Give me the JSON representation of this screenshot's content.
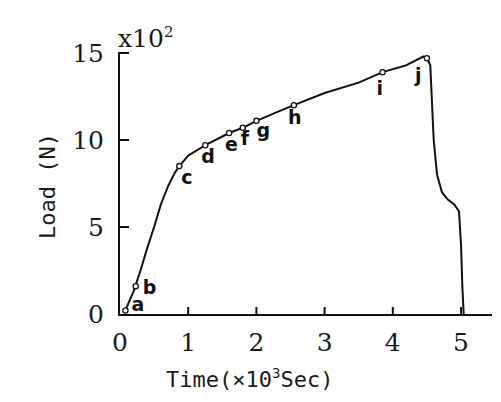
{
  "chart_data": {
    "type": "line",
    "title": "",
    "xlabel": "Time(×10³Sec)",
    "ylabel": "Load (N)",
    "y_multiplier_label": "x10²",
    "xlim": [
      0,
      5.4
    ],
    "ylim": [
      0,
      15
    ],
    "x_ticks": [
      0,
      1,
      2,
      3,
      4,
      5
    ],
    "x_tick_labels": [
      "0",
      "1",
      "2",
      "3",
      "4",
      "5"
    ],
    "y_ticks": [
      0,
      5,
      10,
      15
    ],
    "y_tick_labels": [
      "0",
      "5",
      "10",
      "15"
    ],
    "grid": false,
    "legend": null,
    "series": [
      {
        "name": "Load",
        "x": [
          0.05,
          0.1,
          0.2,
          0.3,
          0.4,
          0.5,
          0.6,
          0.7,
          0.8,
          0.87,
          1.0,
          1.25,
          1.5,
          1.6,
          1.8,
          2.0,
          2.3,
          2.55,
          3.0,
          3.5,
          3.85,
          4.2,
          4.45,
          4.5,
          4.55,
          4.57,
          4.6,
          4.65,
          4.72,
          4.8,
          4.9,
          4.97,
          5.0,
          5.02,
          5.04
        ],
        "values": [
          0.1,
          0.4,
          1.3,
          2.5,
          3.8,
          5.0,
          6.3,
          7.3,
          8.1,
          8.5,
          9.1,
          9.7,
          10.2,
          10.4,
          10.7,
          11.1,
          11.6,
          12.0,
          12.7,
          13.3,
          13.9,
          14.3,
          14.8,
          14.7,
          14.3,
          12.5,
          10.0,
          8.0,
          7.0,
          6.6,
          6.3,
          5.9,
          4.0,
          1.5,
          0.0
        ]
      }
    ],
    "annotations": [
      {
        "label": "a",
        "x": 0.08,
        "y": 0.2
      },
      {
        "label": "b",
        "x": 0.23,
        "y": 1.6
      },
      {
        "label": "c",
        "x": 0.87,
        "y": 8.5
      },
      {
        "label": "d",
        "x": 1.25,
        "y": 9.7
      },
      {
        "label": "e",
        "x": 1.6,
        "y": 10.4
      },
      {
        "label": "f",
        "x": 1.8,
        "y": 10.7
      },
      {
        "label": "g",
        "x": 2.0,
        "y": 11.1
      },
      {
        "label": "h",
        "x": 2.55,
        "y": 12.0
      },
      {
        "label": "i",
        "x": 3.85,
        "y": 13.9
      },
      {
        "label": "j",
        "x": 4.5,
        "y": 14.7
      }
    ]
  },
  "labels": {
    "y_axis_title": "Load (N)",
    "x_axis_title": "Time(×10",
    "x_axis_exp": "3",
    "x_axis_unit": "Sec)",
    "y_multiplier_base": "x10",
    "y_multiplier_exp": "2"
  }
}
